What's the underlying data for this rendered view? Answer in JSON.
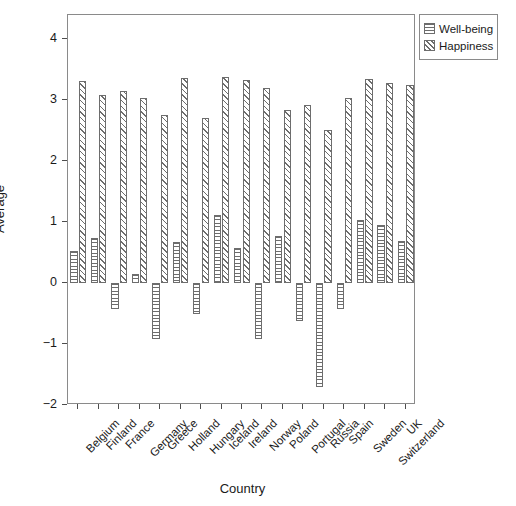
{
  "chart_data": {
    "type": "bar",
    "title": "",
    "xlabel": "Country",
    "ylabel": "Average",
    "ylim": [
      -2,
      4.4
    ],
    "yticks": [
      4,
      3,
      2,
      1,
      0,
      -1,
      -2
    ],
    "ytick_labels": [
      "4",
      "3",
      "2",
      "1",
      "0",
      "−1",
      "−2"
    ],
    "grid": false,
    "legend_position": "top-right",
    "categories": [
      "Belgium",
      "Finland",
      "France",
      "Germany",
      "Greece",
      "Holland",
      "Hungary",
      "Iceland",
      "Ireland",
      "Norway",
      "Poland",
      "Portugal",
      "Russia",
      "Spain",
      "Sweden",
      "Switzerland",
      "UK"
    ],
    "series": [
      {
        "name": "Well-being",
        "pattern": "horizontal-lines",
        "values": [
          0.52,
          0.74,
          -0.42,
          0.15,
          -0.92,
          0.68,
          -0.5,
          1.11,
          0.58,
          -0.92,
          0.77,
          -0.62,
          -1.7,
          -0.42,
          1.03,
          0.95,
          0.69
        ]
      },
      {
        "name": "Happiness",
        "pattern": "diagonal-hatch",
        "values": [
          3.31,
          3.09,
          3.15,
          3.03,
          2.76,
          3.37,
          2.71,
          3.38,
          3.33,
          3.21,
          2.84,
          2.93,
          2.52,
          3.03,
          3.35,
          3.29,
          3.25
        ]
      }
    ]
  },
  "legend": {
    "entries": [
      {
        "label": "Well-being",
        "swatch": "horizontal-lines-swatch"
      },
      {
        "label": "Happiness",
        "swatch": "diagonal-hatch-swatch"
      }
    ]
  }
}
